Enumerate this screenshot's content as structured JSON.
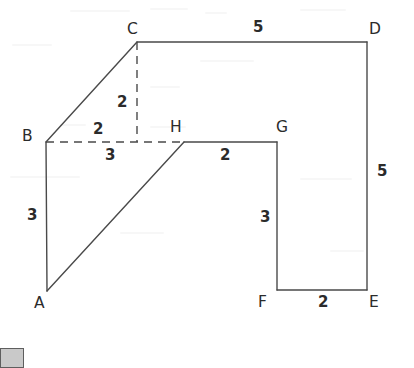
{
  "figure": {
    "stroke_color": "#4a4a4a",
    "dash_color": "#4a4a4a",
    "background_color": "#ffffff",
    "text_color": "#2b2b2b"
  },
  "vertices": [
    {
      "id": "A",
      "label": "A",
      "x": 47,
      "y": 291,
      "label_x": 34,
      "label_y": 296
    },
    {
      "id": "B",
      "label": "B",
      "x": 46,
      "y": 142,
      "label_x": 22,
      "label_y": 129
    },
    {
      "id": "C",
      "label": "C",
      "x": 137,
      "y": 42,
      "label_x": 127,
      "label_y": 22
    },
    {
      "id": "D",
      "label": "D",
      "x": 367,
      "y": 42,
      "label_x": 369,
      "label_y": 22
    },
    {
      "id": "E",
      "label": "E",
      "x": 367,
      "y": 290,
      "label_x": 369,
      "label_y": 295
    },
    {
      "id": "F",
      "label": "F",
      "x": 277,
      "y": 290,
      "label_x": 258,
      "label_y": 295
    },
    {
      "id": "G",
      "label": "G",
      "x": 277,
      "y": 142,
      "label_x": 276,
      "label_y": 120
    },
    {
      "id": "H",
      "label": "H",
      "x": 184,
      "y": 142,
      "label_x": 170,
      "label_y": 120
    }
  ],
  "solid_edges": [
    {
      "name": "edge-B-C",
      "from": "B",
      "to": "C"
    },
    {
      "name": "edge-C-D",
      "from": "C",
      "to": "D"
    },
    {
      "name": "edge-D-E",
      "from": "D",
      "to": "E"
    },
    {
      "name": "edge-E-F",
      "from": "E",
      "to": "F"
    },
    {
      "name": "edge-F-G",
      "from": "F",
      "to": "G"
    },
    {
      "name": "edge-G-H",
      "from": "G",
      "to": "H"
    },
    {
      "name": "edge-H-A",
      "from": "H",
      "to": "A"
    },
    {
      "name": "edge-A-B",
      "from": "A",
      "to": "B"
    }
  ],
  "dashed_edges": [
    {
      "name": "dashed-B-H",
      "x1": 46,
      "y1": 142,
      "x2": 184,
      "y2": 142
    },
    {
      "name": "dashed-C-vertical",
      "x1": 137,
      "y1": 42,
      "x2": 137,
      "y2": 142
    }
  ],
  "measures": [
    {
      "name": "measure-CD",
      "value": "5",
      "x": 253,
      "y": 20,
      "edge": "C-D"
    },
    {
      "name": "measure-DE",
      "value": "5",
      "x": 377,
      "y": 164,
      "edge": "D-E"
    },
    {
      "name": "measure-EF",
      "value": "2",
      "x": 318,
      "y": 295,
      "edge": "F-E"
    },
    {
      "name": "measure-FG",
      "value": "3",
      "x": 260,
      "y": 210,
      "edge": "G-F"
    },
    {
      "name": "measure-GH",
      "value": "2",
      "x": 220,
      "y": 148,
      "edge": "H-G"
    },
    {
      "name": "measure-AB",
      "value": "3",
      "x": 27,
      "y": 208,
      "edge": "A-B"
    },
    {
      "name": "measure-BH-upper",
      "value": "2",
      "x": 93,
      "y": 122,
      "edge": "B-midpoint"
    },
    {
      "name": "measure-C-vertical",
      "value": "2",
      "x": 117,
      "y": 95,
      "edge": "C-drop"
    },
    {
      "name": "measure-BH-lower",
      "value": "3",
      "x": 105,
      "y": 148,
      "edge": "B-H"
    }
  ],
  "corner_swatch": {
    "name": "corner-swatch",
    "x": 0,
    "y": 348,
    "width": 22,
    "height": 18,
    "fill": "#c9c9c9",
    "border": "#5e5e5e"
  }
}
